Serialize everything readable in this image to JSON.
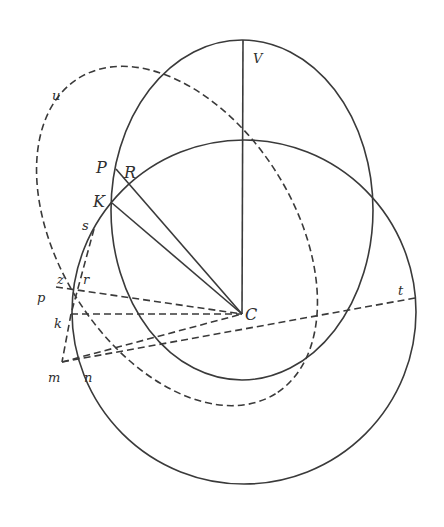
{
  "figure": {
    "type": "geometric-diagram",
    "background": "#ffffff",
    "stroke_color": "#3a3a3a",
    "labels": {
      "V": "V",
      "u": "u",
      "P": "P",
      "R": "R",
      "K": "K",
      "s": "s",
      "z": "z",
      "r": "r",
      "p": "p",
      "k": "k",
      "C": "C",
      "t": "t",
      "m": "m",
      "n": "n"
    },
    "shapes": [
      {
        "name": "upright-ellipse",
        "style": "solid",
        "cx": 242,
        "cy": 210,
        "rx": 131,
        "ry": 170
      },
      {
        "name": "large-circle",
        "style": "solid",
        "cx": 244,
        "cy": 312,
        "r": 172
      },
      {
        "name": "tilted-dashed-ellipse",
        "style": "dashed",
        "cx": 177,
        "cy": 236,
        "rx": 186,
        "ry": 118,
        "rotation_deg": 58
      }
    ],
    "lines": [
      {
        "name": "line-V-C",
        "style": "solid",
        "from": [
          243,
          40
        ],
        "to": [
          242,
          314
        ]
      },
      {
        "name": "line-P-C",
        "style": "solid",
        "from": [
          116,
          169
        ],
        "to": [
          242,
          314
        ]
      },
      {
        "name": "line-K-C",
        "style": "solid",
        "from": [
          112,
          203
        ],
        "to": [
          242,
          314
        ]
      },
      {
        "name": "line-z-C",
        "style": "dashed",
        "from": [
          56,
          287
        ],
        "to": [
          242,
          314
        ]
      },
      {
        "name": "line-k-C",
        "style": "dashed",
        "from": [
          71,
          314
        ],
        "to": [
          242,
          314
        ]
      },
      {
        "name": "line-m-C",
        "style": "dashed",
        "from": [
          62,
          362
        ],
        "to": [
          242,
          314
        ]
      },
      {
        "name": "line-m-t",
        "style": "dashed",
        "from": [
          62,
          362
        ],
        "to": [
          415,
          298
        ]
      },
      {
        "name": "line-s-k",
        "style": "dashed",
        "from": [
          94,
          229
        ],
        "to": [
          71,
          314
        ]
      },
      {
        "name": "line-k-m",
        "style": "dashed",
        "from": [
          71,
          314
        ],
        "to": [
          62,
          362
        ]
      }
    ]
  }
}
